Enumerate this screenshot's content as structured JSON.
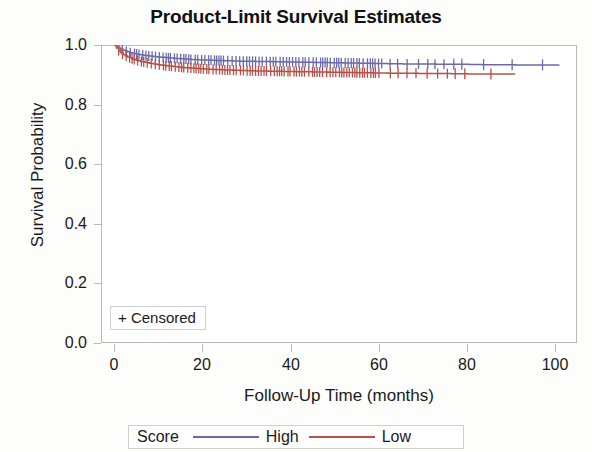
{
  "chart_data": {
    "type": "line",
    "title": "Product-Limit Survival Estimates",
    "xlabel": "Follow-Up Time (months)",
    "ylabel": "Survival Probability",
    "xlim": [
      -3,
      105
    ],
    "ylim": [
      0.0,
      1.0
    ],
    "grid": false,
    "legend_position": "bottom",
    "legend_title": "Score",
    "censored_label": "+ Censored",
    "xticks": [
      "0",
      "20",
      "40",
      "60",
      "80",
      "100"
    ],
    "xtick_values": [
      0,
      20,
      40,
      60,
      80,
      100
    ],
    "yticks": [
      "0.0",
      "0.2",
      "0.4",
      "0.6",
      "0.8",
      "1.0"
    ],
    "ytick_values": [
      0.0,
      0.2,
      0.4,
      0.6,
      0.8,
      1.0
    ],
    "series": [
      {
        "name": "High",
        "color": "#6a6aaa",
        "x": [
          0,
          0.5,
          1,
          1.5,
          2,
          3,
          4,
          5,
          6,
          8,
          10,
          12,
          14,
          16,
          18,
          20,
          24,
          28,
          32,
          36,
          40,
          44,
          48,
          52,
          56,
          60,
          64,
          68,
          72,
          76,
          80,
          84,
          88,
          92,
          96,
          101
        ],
        "values": [
          1.0,
          0.995,
          0.99,
          0.986,
          0.982,
          0.977,
          0.973,
          0.97,
          0.967,
          0.963,
          0.96,
          0.957,
          0.955,
          0.953,
          0.951,
          0.95,
          0.948,
          0.946,
          0.945,
          0.944,
          0.943,
          0.942,
          0.941,
          0.94,
          0.939,
          0.938,
          0.937,
          0.936,
          0.936,
          0.935,
          0.935,
          0.934,
          0.934,
          0.933,
          0.933,
          0.933
        ]
      },
      {
        "name": "Low",
        "color": "#b5514a",
        "x": [
          0,
          0.5,
          1,
          1.5,
          2,
          3,
          4,
          5,
          6,
          8,
          10,
          12,
          14,
          16,
          18,
          20,
          24,
          28,
          32,
          36,
          40,
          44,
          48,
          52,
          56,
          60,
          64,
          68,
          72,
          76,
          80,
          84,
          88,
          91
        ],
        "values": [
          1.0,
          0.99,
          0.981,
          0.974,
          0.968,
          0.96,
          0.954,
          0.949,
          0.945,
          0.939,
          0.934,
          0.93,
          0.927,
          0.924,
          0.922,
          0.92,
          0.917,
          0.915,
          0.913,
          0.912,
          0.911,
          0.91,
          0.909,
          0.908,
          0.907,
          0.906,
          0.905,
          0.905,
          0.904,
          0.904,
          0.903,
          0.903,
          0.903,
          0.903
        ]
      }
    ]
  }
}
